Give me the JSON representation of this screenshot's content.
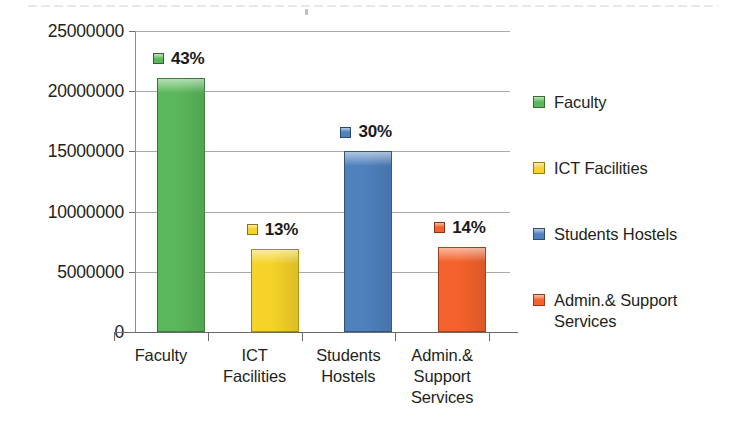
{
  "chart_data": {
    "type": "bar",
    "title": "",
    "subtitle": "",
    "xlabel": "",
    "ylabel": "",
    "categories": [
      "Faculty",
      "ICT Facilities",
      "Students Hostels",
      "Admin.& Support Services"
    ],
    "category_lines": [
      [
        "Faculty"
      ],
      [
        "ICT",
        "Facilities"
      ],
      [
        "Students",
        "Hostels"
      ],
      [
        "Admin.&",
        "Support",
        "Services"
      ]
    ],
    "values": [
      21100000,
      6900000,
      15000000,
      7100000
    ],
    "data_labels": [
      "43%",
      "13%",
      "30%",
      "14%"
    ],
    "colors": [
      "#5BB75B",
      "#F5D328",
      "#4F81BD",
      "#F4622B"
    ],
    "ylim": [
      0,
      25000000
    ],
    "ytick_values": [
      0,
      5000000,
      10000000,
      15000000,
      20000000,
      25000000
    ],
    "ytick_labels": [
      "0",
      "5000000",
      "10000000",
      "15000000",
      "20000000",
      "25000000"
    ],
    "grid": true,
    "grid_axis": "y",
    "legend": {
      "position": "right",
      "entries": [
        {
          "label": "Faculty",
          "color": "#5BB75B"
        },
        {
          "label": "ICT Facilities",
          "color": "#F5D328"
        },
        {
          "label": "Students Hostels",
          "color": "#4F81BD"
        },
        {
          "label": "Admin.& Support Services",
          "color": "#F4622B"
        }
      ]
    },
    "series": [
      {
        "name": "Budget Allocation",
        "points": [
          {
            "category": "Faculty",
            "value": 21100000,
            "label": "43%",
            "color": "#5BB75B"
          },
          {
            "category": "ICT Facilities",
            "value": 6900000,
            "label": "13%",
            "color": "#F5D328"
          },
          {
            "category": "Students Hostels",
            "value": 15000000,
            "label": "30%",
            "color": "#4F81BD"
          },
          {
            "category": "Admin.& Support Services",
            "value": 7100000,
            "label": "14%",
            "color": "#F4622B"
          }
        ]
      }
    ]
  },
  "axis": {
    "y_labels": [
      "25000000",
      "20000000",
      "15000000",
      "10000000",
      "5000000",
      "0"
    ]
  },
  "legend_items": [
    {
      "label": "Faculty"
    },
    {
      "label": "ICT Facilities"
    },
    {
      "label": "Students Hostels"
    },
    {
      "label": "Admin.& Support Services"
    }
  ]
}
